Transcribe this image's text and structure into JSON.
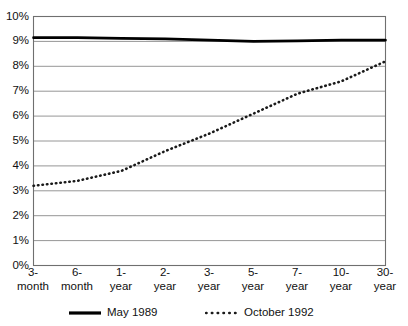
{
  "chart_data": {
    "type": "line",
    "title": "",
    "xlabel": "",
    "ylabel": "",
    "categories": [
      "3-month",
      "6-month",
      "1-year",
      "2-year",
      "3-year",
      "5-year",
      "7-year",
      "10-year",
      "30-year"
    ],
    "ylim": [
      0,
      10
    ],
    "ytick_labels": [
      "0%",
      "1%",
      "2%",
      "3%",
      "4%",
      "5%",
      "6%",
      "7%",
      "8%",
      "9%",
      "10%"
    ],
    "ytick_values": [
      0,
      1,
      2,
      3,
      4,
      5,
      6,
      7,
      8,
      9,
      10
    ],
    "grid": true,
    "legend_position": "bottom",
    "series": [
      {
        "name": "May 1989",
        "style": "solid",
        "color": "#000000",
        "values": [
          9.15,
          9.15,
          9.12,
          9.1,
          9.05,
          9.0,
          9.02,
          9.05,
          9.05
        ]
      },
      {
        "name": "October 1992",
        "style": "dotted",
        "color": "#1a1a1a",
        "values": [
          3.2,
          3.4,
          3.8,
          4.6,
          5.3,
          6.1,
          6.9,
          7.4,
          8.2
        ]
      }
    ]
  },
  "axes": {
    "y_ticks": [
      {
        "label": "10%",
        "value": 10
      },
      {
        "label": "9%",
        "value": 9
      },
      {
        "label": "8%",
        "value": 8
      },
      {
        "label": "7%",
        "value": 7
      },
      {
        "label": "6%",
        "value": 6
      },
      {
        "label": "5%",
        "value": 5
      },
      {
        "label": "4%",
        "value": 4
      },
      {
        "label": "3%",
        "value": 3
      },
      {
        "label": "2%",
        "value": 2
      },
      {
        "label": "1%",
        "value": 1
      },
      {
        "label": "0%",
        "value": 0
      }
    ],
    "x_ticks": [
      {
        "label": "3-\nmonth"
      },
      {
        "label": "6-\nmonth"
      },
      {
        "label": "1-\nyear"
      },
      {
        "label": "2-\nyear"
      },
      {
        "label": "3-\nyear"
      },
      {
        "label": "5-\nyear"
      },
      {
        "label": "7-\nyear"
      },
      {
        "label": "10-\nyear"
      },
      {
        "label": "30-\nyear"
      }
    ]
  },
  "legend": {
    "items": [
      {
        "label": "May 1989",
        "style": "solid"
      },
      {
        "label": "October 1992",
        "style": "dotted"
      }
    ]
  },
  "colors": {
    "line_solid": "#000000",
    "line_dotted": "#1a1a1a",
    "grid": "#8a8a8a",
    "axis": "#6f6f6f",
    "background": "#ffffff"
  }
}
